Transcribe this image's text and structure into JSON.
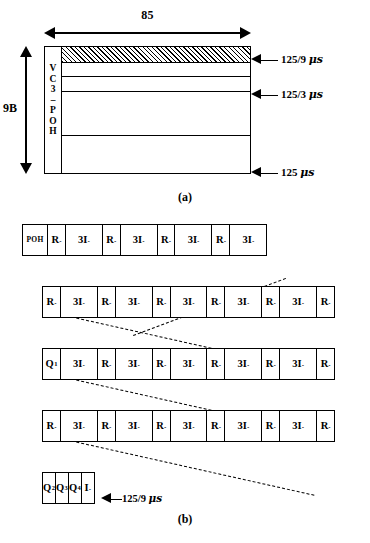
{
  "figure": {
    "panel_a": {
      "caption": "(a)",
      "width_label": "85",
      "height_label": "9B",
      "poh_label_chars": [
        "V",
        "C",
        "3",
        "–",
        "P",
        "O",
        "H"
      ],
      "timing_labels": [
        {
          "text": "125/9 ",
          "unit": "μs"
        },
        {
          "text": "125/3 ",
          "unit": "μs"
        },
        {
          "text": "125 ",
          "unit": "μs"
        }
      ]
    },
    "panel_b": {
      "caption": "(b)",
      "timing_label": {
        "arrow": "←",
        "text": "125/9 ",
        "unit": "μs"
      },
      "rows": [
        {
          "name": "row-1",
          "cells": [
            {
              "type": "poh",
              "label": "POH",
              "sub": ""
            },
            {
              "type": "r",
              "label": "R",
              "sub": "ₒ"
            },
            {
              "type": "i",
              "label": "3I",
              "sub": "ₒ"
            },
            {
              "type": "r",
              "label": "R",
              "sub": "ₒ"
            },
            {
              "type": "i",
              "label": "3I",
              "sub": "ₒ"
            },
            {
              "type": "r",
              "label": "R",
              "sub": "ₒ"
            },
            {
              "type": "i",
              "label": "3I",
              "sub": "ₒ"
            },
            {
              "type": "r",
              "label": "R",
              "sub": "ₒ"
            },
            {
              "type": "i",
              "label": "3I",
              "sub": "ₒ"
            }
          ]
        },
        {
          "name": "row-2",
          "cells": [
            {
              "type": "r",
              "label": "R",
              "sub": "ₒ"
            },
            {
              "type": "i",
              "label": "3I",
              "sub": "ₒ"
            },
            {
              "type": "r",
              "label": "R",
              "sub": "ₒ"
            },
            {
              "type": "i",
              "label": "3I",
              "sub": "ₒ"
            },
            {
              "type": "r",
              "label": "R",
              "sub": "ₒ"
            },
            {
              "type": "i",
              "label": "3I",
              "sub": "ₒ"
            },
            {
              "type": "r",
              "label": "R",
              "sub": "ₒ"
            },
            {
              "type": "i",
              "label": "3I",
              "sub": "ₒ"
            },
            {
              "type": "r",
              "label": "R",
              "sub": "ₒ"
            },
            {
              "type": "i",
              "label": "3I",
              "sub": "ₒ"
            },
            {
              "type": "r",
              "label": "R",
              "sub": "ₒ"
            }
          ]
        },
        {
          "name": "row-3",
          "cells": [
            {
              "type": "r",
              "label": "Q",
              "sub": "1"
            },
            {
              "type": "i",
              "label": "3I",
              "sub": "ₒ"
            },
            {
              "type": "r",
              "label": "R",
              "sub": "ₒ"
            },
            {
              "type": "i",
              "label": "3I",
              "sub": "ₒ"
            },
            {
              "type": "r",
              "label": "R",
              "sub": "ₒ"
            },
            {
              "type": "i",
              "label": "3I",
              "sub": "ₒ"
            },
            {
              "type": "r",
              "label": "R",
              "sub": "ₒ"
            },
            {
              "type": "i",
              "label": "3I",
              "sub": "ₒ"
            },
            {
              "type": "r",
              "label": "R",
              "sub": "ₒ"
            },
            {
              "type": "i",
              "label": "3I",
              "sub": "ₒ"
            },
            {
              "type": "r",
              "label": "R",
              "sub": "ₒ"
            }
          ]
        },
        {
          "name": "row-4",
          "cells": [
            {
              "type": "r",
              "label": "R",
              "sub": "ₒ"
            },
            {
              "type": "i",
              "label": "3I",
              "sub": "ₒ"
            },
            {
              "type": "r",
              "label": "R",
              "sub": "ₒ"
            },
            {
              "type": "i",
              "label": "3I",
              "sub": "ₒ"
            },
            {
              "type": "r",
              "label": "R",
              "sub": "ₒ"
            },
            {
              "type": "i",
              "label": "3I",
              "sub": "ₒ"
            },
            {
              "type": "r",
              "label": "R",
              "sub": "ₒ"
            },
            {
              "type": "i",
              "label": "3I",
              "sub": "ₒ"
            },
            {
              "type": "r",
              "label": "R",
              "sub": "ₒ"
            },
            {
              "type": "i",
              "label": "3I",
              "sub": "ₒ"
            },
            {
              "type": "r",
              "label": "R",
              "sub": "ₒ"
            }
          ]
        },
        {
          "name": "row-5",
          "cells": [
            {
              "type": "q",
              "label": "Q",
              "sub": "2"
            },
            {
              "type": "q",
              "label": "Q",
              "sub": "3"
            },
            {
              "type": "q",
              "label": "Q",
              "sub": "4"
            },
            {
              "type": "q",
              "label": "I",
              "sub": "ₒ"
            }
          ]
        }
      ]
    }
  }
}
